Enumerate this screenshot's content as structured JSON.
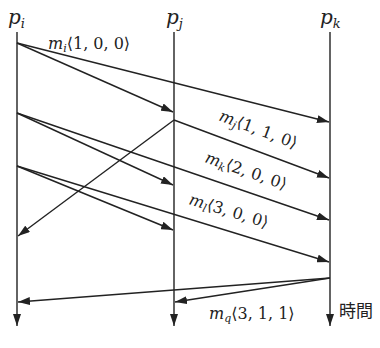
{
  "processes": [
    {
      "id": "pi",
      "name": "p",
      "sub": "i"
    },
    {
      "id": "pj",
      "name": "p",
      "sub": "j"
    },
    {
      "id": "pk",
      "name": "p",
      "sub": "k"
    }
  ],
  "time_label": "時間",
  "messages": [
    {
      "id": "mi-to-pj",
      "from": "pi",
      "to": "pj",
      "label": null
    },
    {
      "id": "mi-to-pk",
      "from": "pi",
      "to": "pk",
      "label": {
        "name": "m",
        "sub": "i",
        "vector": "⟨1, 0, 0⟩"
      }
    },
    {
      "id": "mj-to-pi",
      "from": "pj",
      "to": "pi",
      "label": null
    },
    {
      "id": "mj-to-pk",
      "from": "pj",
      "to": "pk",
      "label": {
        "name": "m",
        "sub": "j",
        "vector": "⟨1, 1, 0⟩"
      }
    },
    {
      "id": "mk-to-pj",
      "from": "pi",
      "to": "pj",
      "label": null
    },
    {
      "id": "mk-to-pk",
      "from": "pi",
      "to": "pk",
      "label": {
        "name": "m",
        "sub": "k",
        "vector": "⟨2, 0, 0⟩"
      }
    },
    {
      "id": "ml-to-pj",
      "from": "pi",
      "to": "pj",
      "label": null
    },
    {
      "id": "ml-to-pk",
      "from": "pi",
      "to": "pk",
      "label": {
        "name": "m",
        "sub": "l",
        "vector": "⟨3, 0, 0⟩"
      }
    },
    {
      "id": "mq-to-pi",
      "from": "pk",
      "to": "pi",
      "label": null
    },
    {
      "id": "mq-to-pj",
      "from": "pk",
      "to": "pj",
      "label": {
        "name": "m",
        "sub": "q",
        "vector": "⟨3, 1, 1⟩"
      }
    }
  ]
}
